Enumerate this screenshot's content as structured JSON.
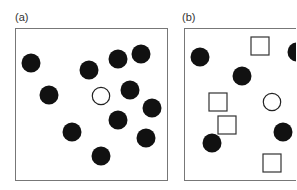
{
  "panels": [
    {
      "label": "(a)",
      "box": {
        "x": 15,
        "y": 28,
        "w": 153,
        "h": 153
      },
      "shapes": [
        {
          "type": "filled-circle",
          "cx": 31,
          "cy": 63
        },
        {
          "type": "filled-circle",
          "cx": 89,
          "cy": 70
        },
        {
          "type": "filled-circle",
          "cx": 118,
          "cy": 59
        },
        {
          "type": "filled-circle",
          "cx": 141,
          "cy": 54
        },
        {
          "type": "filled-circle",
          "cx": 49,
          "cy": 95
        },
        {
          "type": "hollow-circle",
          "cx": 101,
          "cy": 96
        },
        {
          "type": "filled-circle",
          "cx": 130,
          "cy": 90
        },
        {
          "type": "filled-circle",
          "cx": 152,
          "cy": 108
        },
        {
          "type": "filled-circle",
          "cx": 118,
          "cy": 120
        },
        {
          "type": "filled-circle",
          "cx": 72,
          "cy": 132
        },
        {
          "type": "filled-circle",
          "cx": 146,
          "cy": 138
        },
        {
          "type": "filled-circle",
          "cx": 101,
          "cy": 156
        }
      ]
    },
    {
      "label": "(b)",
      "box": {
        "x": 184,
        "y": 28,
        "w": 120,
        "h": 153
      },
      "shapes": [
        {
          "type": "filled-circle",
          "cx": 200,
          "cy": 57
        },
        {
          "type": "square",
          "cx": 260,
          "cy": 46
        },
        {
          "type": "filled-circle",
          "cx": 297,
          "cy": 52
        },
        {
          "type": "filled-circle",
          "cx": 242,
          "cy": 76
        },
        {
          "type": "square",
          "cx": 218,
          "cy": 102
        },
        {
          "type": "hollow-circle",
          "cx": 272,
          "cy": 102
        },
        {
          "type": "square",
          "cx": 227,
          "cy": 125
        },
        {
          "type": "filled-circle",
          "cx": 283,
          "cy": 132
        },
        {
          "type": "filled-circle",
          "cx": 212,
          "cy": 143
        },
        {
          "type": "square",
          "cx": 272,
          "cy": 163
        }
      ]
    }
  ],
  "style": {
    "ink": "#111111",
    "border": "#777777",
    "radius": 9.5,
    "square_size": 18
  }
}
